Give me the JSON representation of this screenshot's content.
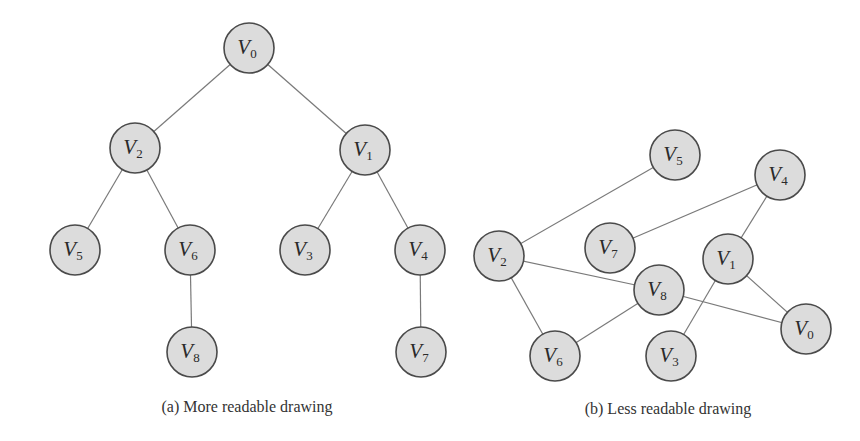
{
  "node_radius": 25,
  "colors": {
    "node_fill": "#dcdcdc",
    "node_stroke": "#4a4a4a",
    "edge": "#7a7a7a",
    "text": "#2a2a2a"
  },
  "graphs": [
    {
      "id": "a",
      "caption": "(a)  More readable drawing",
      "caption_pos": [
        247,
        398
      ],
      "nodes": [
        {
          "id": "V0",
          "letter": "V",
          "sub": "0",
          "x": 249,
          "y": 48
        },
        {
          "id": "V2",
          "letter": "V",
          "sub": "2",
          "x": 135,
          "y": 148
        },
        {
          "id": "V1",
          "letter": "V",
          "sub": "1",
          "x": 365,
          "y": 150
        },
        {
          "id": "V5",
          "letter": "V",
          "sub": "5",
          "x": 75,
          "y": 250
        },
        {
          "id": "V6",
          "letter": "V",
          "sub": "6",
          "x": 190,
          "y": 250
        },
        {
          "id": "V3",
          "letter": "V",
          "sub": "3",
          "x": 305,
          "y": 250
        },
        {
          "id": "V4",
          "letter": "V",
          "sub": "4",
          "x": 420,
          "y": 250
        },
        {
          "id": "V8",
          "letter": "V",
          "sub": "8",
          "x": 192,
          "y": 352
        },
        {
          "id": "V7",
          "letter": "V",
          "sub": "7",
          "x": 421,
          "y": 352
        }
      ],
      "edges": [
        [
          "V0",
          "V2"
        ],
        [
          "V0",
          "V1"
        ],
        [
          "V2",
          "V5"
        ],
        [
          "V2",
          "V6"
        ],
        [
          "V1",
          "V3"
        ],
        [
          "V1",
          "V4"
        ],
        [
          "V6",
          "V8"
        ],
        [
          "V4",
          "V7"
        ]
      ]
    },
    {
      "id": "b",
      "caption": "(b)  Less readable drawing",
      "caption_pos": [
        668,
        400
      ],
      "nodes": [
        {
          "id": "V5",
          "letter": "V",
          "sub": "5",
          "x": 675,
          "y": 155
        },
        {
          "id": "V4",
          "letter": "V",
          "sub": "4",
          "x": 780,
          "y": 175
        },
        {
          "id": "V2",
          "letter": "V",
          "sub": "2",
          "x": 499,
          "y": 256
        },
        {
          "id": "V7",
          "letter": "V",
          "sub": "7",
          "x": 610,
          "y": 248
        },
        {
          "id": "V1",
          "letter": "V",
          "sub": "1",
          "x": 728,
          "y": 259
        },
        {
          "id": "V8",
          "letter": "V",
          "sub": "8",
          "x": 659,
          "y": 290
        },
        {
          "id": "V0",
          "letter": "V",
          "sub": "0",
          "x": 806,
          "y": 329
        },
        {
          "id": "V6",
          "letter": "V",
          "sub": "6",
          "x": 555,
          "y": 356
        },
        {
          "id": "V3",
          "letter": "V",
          "sub": "3",
          "x": 671,
          "y": 356
        }
      ],
      "edges": [
        [
          "V2",
          "V5"
        ],
        [
          "V7",
          "V4"
        ],
        [
          "V4",
          "V1"
        ],
        [
          "V2",
          "V8"
        ],
        [
          "V2",
          "V6"
        ],
        [
          "V8",
          "V6"
        ],
        [
          "V8",
          "V0"
        ],
        [
          "V1",
          "V0"
        ],
        [
          "V1",
          "V3"
        ]
      ]
    }
  ]
}
